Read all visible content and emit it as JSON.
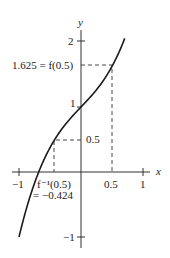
{
  "figure": {
    "function": "f(x) = x^3 + x + 1",
    "axes": {
      "x_label": "x",
      "y_label": "y",
      "x_ticks": [
        {
          "value": -1,
          "label": "−1"
        },
        {
          "value": 0.5,
          "label": "0.5"
        },
        {
          "value": 1,
          "label": "1"
        }
      ],
      "y_ticks": [
        {
          "value": 2,
          "label": "2"
        },
        {
          "value": 1,
          "label": "1"
        },
        {
          "value": 0.5,
          "label": "0.5"
        },
        {
          "value": -1,
          "label": "−1"
        }
      ]
    },
    "annotations": {
      "f_at_half": "1.625 = f(0.5)",
      "finv_line1": "f⁻¹(0.5)",
      "finv_line2": "= −0.424"
    },
    "line_color": "#1a1a1a"
  }
}
